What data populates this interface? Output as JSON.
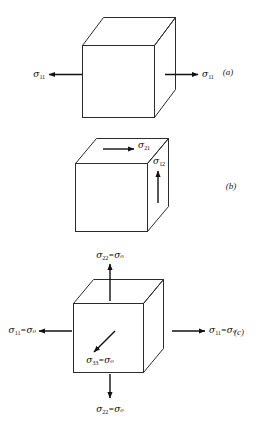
{
  "figure": {
    "background_color": "#ffffff",
    "line_color": "#1a1a1a",
    "text_color": "#0d0d0d",
    "panels": [
      {
        "tag": "(a)",
        "description": "uniaxial tension",
        "labels": [
          {
            "name": "sigma-11-left",
            "symbol": "σ",
            "subscript": "11",
            "equals": "",
            "value": ""
          },
          {
            "name": "sigma-11-right",
            "symbol": "σ",
            "subscript": "11",
            "equals": "",
            "value": ""
          }
        ]
      },
      {
        "tag": "(b)",
        "description": "pure shear",
        "labels": [
          {
            "name": "sigma-21-top",
            "symbol": "σ",
            "subscript": "21",
            "equals": "",
            "value": ""
          },
          {
            "name": "sigma-12-right",
            "symbol": "σ",
            "subscript": "12",
            "equals": "",
            "value": ""
          }
        ]
      },
      {
        "tag": "(c)",
        "description": "hydrostatic stress state",
        "labels": [
          {
            "name": "sigma-22-top",
            "symbol": "σ",
            "subscript": "22",
            "equals": "=",
            "value": "σₒ"
          },
          {
            "name": "sigma-22-bottom",
            "symbol": "σ",
            "subscript": "22",
            "equals": "=",
            "value": "σₒ"
          },
          {
            "name": "sigma-11-left",
            "symbol": "σ",
            "subscript": "11",
            "equals": "=",
            "value": "σₒ"
          },
          {
            "name": "sigma-11-right",
            "symbol": "σ",
            "subscript": "11",
            "equals": "=",
            "value": "σₒ"
          },
          {
            "name": "sigma-33-front",
            "symbol": "σ",
            "subscript": "33",
            "equals": "=",
            "value": "σₒ"
          }
        ]
      }
    ]
  },
  "panel_a": {
    "tag": "(a)",
    "label_left_sym": "σ",
    "label_left_sub": "11",
    "label_right_sym": "σ",
    "label_right_sub": "11"
  },
  "panel_b": {
    "tag": "(b)",
    "label_top_sym": "σ",
    "label_top_sub": "21",
    "label_right_sym": "σ",
    "label_right_sub": "12"
  },
  "panel_c": {
    "tag": "(c)",
    "label_top_sym": "σ",
    "label_top_sub": "22",
    "label_top_eq": "=",
    "label_top_val": "σₒ",
    "label_bottom_sym": "σ",
    "label_bottom_sub": "22",
    "label_bottom_eq": "=",
    "label_bottom_val": "σₒ",
    "label_left_sym": "σ",
    "label_left_sub": "11",
    "label_left_eq": "=",
    "label_left_val": "σₒ",
    "label_right_sym": "σ",
    "label_right_sub": "11",
    "label_right_eq": "=",
    "label_right_val": "σₒ",
    "label_front_sym": "σ",
    "label_front_sub": "33",
    "label_front_eq": "=",
    "label_front_val": "σₒ"
  }
}
